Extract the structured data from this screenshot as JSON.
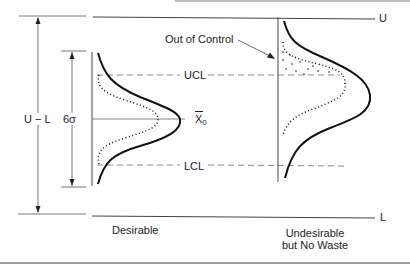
{
  "figure": {
    "labels": {
      "upper_spec": "U",
      "lower_spec": "L",
      "spec_range": "U − L",
      "six_sigma": "6σ",
      "ucl": "UCL",
      "lcl": "LCL",
      "mean": "X",
      "mean_subscript": "0",
      "out_of_control": "Out of Control"
    },
    "captions": {
      "left": "Desirable",
      "right_line1": "Undesirable",
      "right_line2": "but No Waste"
    },
    "colors": {
      "ink": "#222222",
      "dashed": "#8a8a8a",
      "guide": "#9a9a9a"
    }
  }
}
